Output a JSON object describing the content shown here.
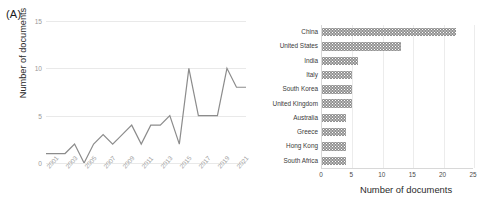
{
  "figure": {
    "panel_a_tag": "(A)",
    "panel_b_tag": "(B)"
  },
  "chart_data": [
    {
      "type": "line",
      "panel": "(A)",
      "title": "",
      "xlabel": "",
      "ylabel": "Number of documents",
      "ylim": [
        0,
        15
      ],
      "yticks": [
        0,
        5,
        10,
        15
      ],
      "ytick_labels": [
        "0",
        "5",
        "10",
        "15"
      ],
      "grid": "horizontal",
      "legend": "none",
      "line_color": "#8c8c8c",
      "x": [
        2001,
        2002,
        2003,
        2004,
        2005,
        2006,
        2007,
        2008,
        2009,
        2010,
        2011,
        2012,
        2013,
        2014,
        2015,
        2016,
        2017,
        2018,
        2019,
        2020,
        2021,
        2022
      ],
      "xtick_labels": [
        "2001",
        "2003",
        "2005",
        "2007",
        "2009",
        "2011",
        "2013",
        "2015",
        "2017",
        "2019",
        "2021"
      ],
      "values": [
        1,
        1,
        1,
        2,
        0,
        2,
        3,
        2,
        3,
        4,
        2,
        4,
        4,
        5,
        2,
        10,
        5,
        5,
        5,
        10,
        8,
        8
      ]
    },
    {
      "type": "bar",
      "orientation": "horizontal",
      "panel": "(B)",
      "title": "",
      "xlabel": "Number of documents",
      "ylabel": "",
      "xlim": [
        0,
        25
      ],
      "xticks": [
        0,
        5,
        10,
        15,
        20,
        25
      ],
      "xtick_labels": [
        "0",
        "5",
        "10",
        "15",
        "20",
        "25"
      ],
      "grid": "vertical",
      "legend": "none",
      "bar_color": "#919191",
      "categories": [
        "China",
        "United States",
        "India",
        "Italy",
        "South Korea",
        "United Kingdom",
        "Australia",
        "Greece",
        "Hong Kong",
        "South Africa"
      ],
      "values": [
        22,
        13,
        6,
        5,
        5,
        5,
        4,
        4,
        4,
        4
      ]
    }
  ]
}
